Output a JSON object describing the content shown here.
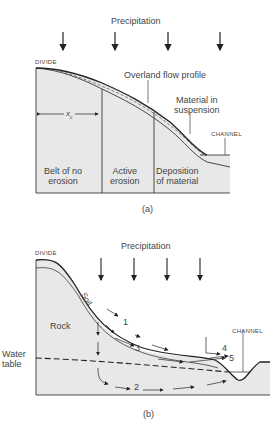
{
  "figure_a": {
    "precipitation": "Precipitation",
    "divide": "DIVIDE",
    "overland_flow": "Overland flow profile",
    "suspension_line1": "Material in",
    "suspension_line2": "suspension",
    "channel": "CHANNEL",
    "xc": "x",
    "xc_sub": "c",
    "zone1_line1": "Belt of no",
    "zone1_line2": "erosion",
    "zone2_line1": "Active",
    "zone2_line2": "erosion",
    "zone3_line1": "Deposition",
    "zone3_line2": "of material",
    "caption": "(a)"
  },
  "figure_b": {
    "precipitation": "Precipitation",
    "divide": "DIVIDE",
    "soil": "Soil",
    "rock": "Rock",
    "water_table_line1": "Water",
    "water_table_line2": "table",
    "channel": "CHANNEL",
    "flow_labels": [
      "1",
      "2",
      "3",
      "4",
      "5"
    ],
    "caption": "(b)"
  },
  "colors": {
    "fill": "#e8e8e8",
    "line": "#222222"
  }
}
